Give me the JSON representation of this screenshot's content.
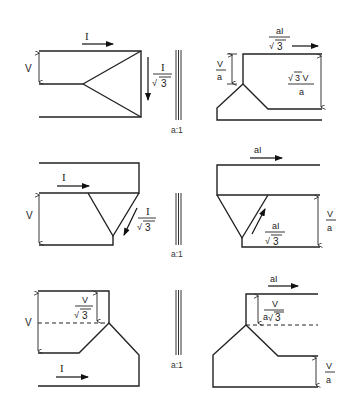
{
  "diagram": {
    "rows": [
      {
        "name": "star-delta",
        "primary": {
          "connection": "star",
          "current_label": "I",
          "voltage_label": "V",
          "phase_current_num": "I",
          "phase_current_den": "3"
        },
        "ratio": "a:1",
        "secondary": {
          "connection": "star",
          "line_current_num": "aI",
          "line_current_den": "3",
          "phase_voltage_num": "V",
          "phase_voltage_den": "a",
          "line_voltage_num": "3 V",
          "line_voltage_den": "a"
        }
      },
      {
        "name": "delta-delta",
        "primary": {
          "connection": "delta",
          "current_label": "I",
          "voltage_label": "V",
          "phase_current_num": "I",
          "phase_current_den": "3"
        },
        "ratio": "a:1",
        "secondary": {
          "connection": "delta",
          "line_current_label": "aI",
          "phase_current_num": "aI",
          "phase_current_den": "3",
          "line_voltage_num": "V",
          "line_voltage_den": "a"
        }
      },
      {
        "name": "star-star",
        "primary": {
          "connection": "star",
          "current_label": "I",
          "voltage_label": "V",
          "phase_voltage_num": "V",
          "phase_voltage_den": "3"
        },
        "ratio": "a:1",
        "secondary": {
          "connection": "star",
          "line_current_label": "aI",
          "phase_voltage_num": "V",
          "phase_voltage_den_prefix": "a",
          "phase_voltage_den": "3",
          "line_voltage_num": "V",
          "line_voltage_den": "a"
        }
      }
    ]
  }
}
